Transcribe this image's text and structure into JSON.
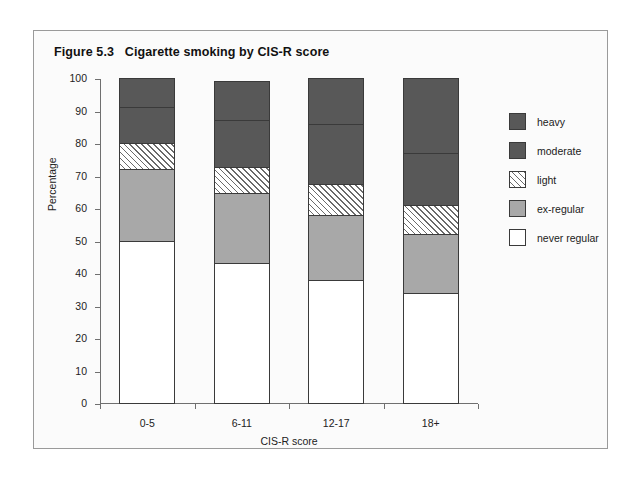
{
  "figure": {
    "title": "Figure 5.3   Cigarette smoking by CIS-R score"
  },
  "chart_data": {
    "type": "bar",
    "subtype": "stacked-percentage",
    "title": "Figure 5.3   Cigarette smoking by CIS-R score",
    "xlabel": "CIS-R score",
    "ylabel": "Percentage",
    "categories": [
      "0-5",
      "6-11",
      "12-17",
      "18+"
    ],
    "ylim": [
      0,
      100
    ],
    "yticks": [
      0,
      10,
      20,
      30,
      40,
      50,
      60,
      70,
      80,
      90,
      100
    ],
    "ytick_labels": [
      "0",
      "10",
      "20",
      "30",
      "40",
      "50",
      "60",
      "70",
      "80",
      "90",
      "100"
    ],
    "grid": false,
    "legend_position": "right",
    "stack_order_bottom_to_top": [
      "never regular",
      "ex-regular",
      "light",
      "moderate",
      "heavy"
    ],
    "series": [
      {
        "name": "never regular",
        "color": "#ffffff",
        "pattern": "solid",
        "values": [
          50,
          43,
          38,
          34
        ]
      },
      {
        "name": "ex-regular",
        "color": "#a8a8a8",
        "pattern": "solid",
        "values": [
          22,
          21.5,
          20,
          18
        ]
      },
      {
        "name": "light",
        "color": "#ffffff",
        "pattern": "hatched",
        "values": [
          8,
          8,
          9.5,
          9
        ]
      },
      {
        "name": "moderate",
        "color": "#585858",
        "pattern": "solid",
        "values": [
          11,
          14.5,
          18.5,
          16
        ]
      },
      {
        "name": "heavy",
        "color": "#585858",
        "pattern": "solid",
        "values": [
          9,
          12,
          14,
          23
        ]
      }
    ],
    "cumulative_tops": [
      [
        50,
        72,
        80,
        91,
        100
      ],
      [
        43,
        64.5,
        72.5,
        87,
        99
      ],
      [
        38,
        58,
        67.5,
        86,
        100
      ],
      [
        34,
        52,
        61,
        77,
        100
      ]
    ]
  },
  "legend": {
    "items": [
      {
        "label": "heavy"
      },
      {
        "label": "moderate"
      },
      {
        "label": "light"
      },
      {
        "label": "ex-regular"
      },
      {
        "label": "never regular"
      }
    ]
  }
}
